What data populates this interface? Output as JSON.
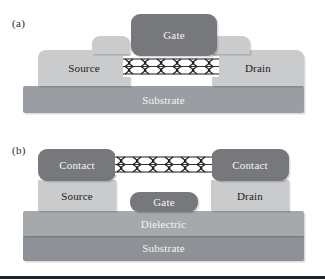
{
  "figure": {
    "type": "diagram",
    "panels": [
      {
        "id": "a",
        "label": "(a)",
        "name": "top-gated-cnt-fet",
        "layers": [
          {
            "name": "gate",
            "label": "Gate",
            "shade": "dark",
            "color": "#77787c"
          },
          {
            "name": "source",
            "label": "Source",
            "shade": "light",
            "color": "#c9cbcd"
          },
          {
            "name": "drain",
            "label": "Drain",
            "shade": "light",
            "color": "#c9cbcd"
          },
          {
            "name": "nanotube",
            "label": "",
            "shade": "lattice",
            "color": "#ffffff"
          },
          {
            "name": "substrate",
            "label": "Substrate",
            "shade": "medium",
            "color": "#9a9da1"
          }
        ]
      },
      {
        "id": "b",
        "label": "(b)",
        "name": "bottom-gated-cnt-fet",
        "layers": [
          {
            "name": "contact-left",
            "label": "Contact",
            "shade": "dark",
            "color": "#77787c"
          },
          {
            "name": "contact-right",
            "label": "Contact",
            "shade": "dark",
            "color": "#77787c"
          },
          {
            "name": "source",
            "label": "Source",
            "shade": "light",
            "color": "#c9cbcd"
          },
          {
            "name": "drain",
            "label": "Drain",
            "shade": "light",
            "color": "#c9cbcd"
          },
          {
            "name": "gate",
            "label": "Gate",
            "shade": "dark",
            "color": "#77787c"
          },
          {
            "name": "nanotube",
            "label": "",
            "shade": "lattice",
            "color": "#ffffff"
          },
          {
            "name": "dielectric",
            "label": "Dielectric",
            "shade": "medium",
            "color": "#a6a9ac"
          },
          {
            "name": "substrate",
            "label": "Substrate",
            "shade": "darker",
            "color": "#8e9195"
          }
        ]
      }
    ]
  },
  "colors": {
    "background": "#ffffff",
    "dark_gray": "#77787c",
    "light_gray": "#c9cbcd",
    "medium_gray": "#9a9da1",
    "dielectric_gray": "#a6a9ac",
    "substrate_gray": "#8e9195",
    "lattice_line": "#1a1a1a",
    "text_dark": "#1d1d1d",
    "text_light": "#f4f4f4",
    "bottom_rule": "#20242a"
  }
}
